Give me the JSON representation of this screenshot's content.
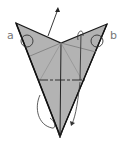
{
  "diagram": {
    "type": "origami-fold-step",
    "labels": {
      "a": "a",
      "b": "b"
    },
    "colors": {
      "paper": "#b3b3b3",
      "outline": "#1a1a1a",
      "crease": "#7a7a7a",
      "label": "#777777",
      "background": "#ffffff"
    }
  }
}
